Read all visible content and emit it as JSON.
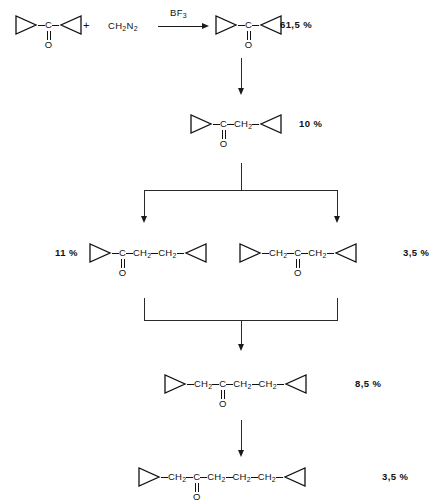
{
  "scheme": {
    "title": "Ring-homologation of dicyclopropyl ketone with diazomethane",
    "reaction_step": {
      "reactant_label": "dicyclopropyl-ketone",
      "plus": "+",
      "coreactant": "CH2N2",
      "coreactant_parts": {
        "head": "CH",
        "sub1": "2",
        "mid": "N",
        "sub2": "2"
      },
      "reagent_over_arrow": "BF3",
      "reagent_parts": {
        "head": "BF",
        "sub": "3"
      }
    },
    "products": [
      {
        "id": "p1",
        "name": "dicyclopropyl ketone",
        "yield": "61,5 %",
        "yield_position": "right",
        "chain": [
          "cyclopropyl-right",
          "C",
          "cyclopropyl-left"
        ],
        "carbonyl_atom": "C",
        "oxygen": "O"
      },
      {
        "id": "p2",
        "name": "cyclopropyl cyclopropylmethyl ketone",
        "yield": "10 %",
        "yield_position": "right",
        "chain": [
          "cyclopropyl-right",
          "C",
          "CH2",
          "cyclopropyl-left"
        ],
        "carbonyl_atom": "C",
        "oxygen": "O"
      },
      {
        "id": "p3",
        "name": "cyclopropyl 2-cyclopropylethyl ketone",
        "yield": "11 %",
        "yield_position": "left",
        "chain": [
          "cyclopropyl-right",
          "C",
          "CH2",
          "CH2",
          "cyclopropyl-left"
        ],
        "carbonyl_atom": "C",
        "oxygen": "O"
      },
      {
        "id": "p4",
        "name": "1,3-dicyclopropylacetone",
        "yield": "3,5 %",
        "yield_position": "right",
        "chain": [
          "cyclopropyl-right",
          "CH2",
          "C",
          "CH2",
          "cyclopropyl-left"
        ],
        "carbonyl_atom": "C",
        "oxygen": "O"
      },
      {
        "id": "p5",
        "name": "1,4-dicyclopropylbutan-2-one",
        "yield": "8,5 %",
        "yield_position": "right",
        "chain": [
          "cyclopropyl-right",
          "CH2",
          "C",
          "CH2",
          "CH2",
          "cyclopropyl-left"
        ],
        "carbonyl_atom": "C",
        "oxygen": "O"
      },
      {
        "id": "p6",
        "name": "1,5-dicyclopropylpentan-2-one",
        "yield": "3,5 %",
        "yield_position": "right",
        "chain": [
          "cyclopropyl-right",
          "CH2",
          "C",
          "CH2",
          "CH2",
          "CH2",
          "cyclopropyl-left"
        ],
        "carbonyl_atom": "C",
        "oxygen": "O"
      }
    ],
    "atom_labels": {
      "carbon": "C",
      "oxygen": "O",
      "methylene_head": "CH",
      "methylene_sub": "2"
    },
    "colors": {
      "ink": "#111111",
      "line": "#2a2a2a",
      "background": "#ffffff"
    }
  }
}
